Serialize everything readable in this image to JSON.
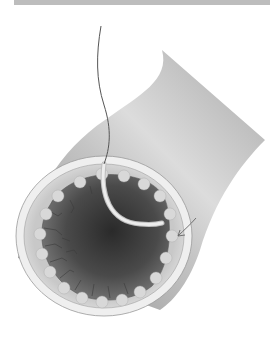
{
  "header": {
    "bar_color": "#bdbdbd"
  },
  "figure": {
    "elements": {
      "vessel_wall": {
        "color_light": "#d9d9d9",
        "color_dark": "#9a9a9a"
      },
      "lumen": {
        "color_center": "#2e2e2e",
        "color_edge": "#6e6e6e"
      },
      "mucosa_rim": {
        "color": "#cfcfcf"
      },
      "outer_ring": {
        "color": "#eeeeee"
      },
      "wire": {
        "color": "#555555"
      },
      "catheter": {
        "color": "#e6e6e6"
      },
      "arrow": {
        "color": "#666666"
      }
    },
    "background": "#ffffff"
  }
}
